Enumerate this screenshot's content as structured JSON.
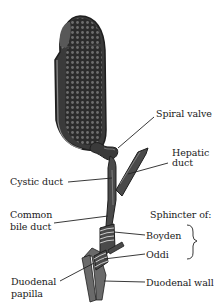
{
  "diagram": {
    "labels": {
      "spiral_valve": "Spiral valve",
      "hepatic_duct_line1": "Hepatic",
      "hepatic_duct_line2": "duct",
      "cystic_duct": "Cystic duct",
      "common_bile_duct_line1": "Common",
      "common_bile_duct_line2": "bile duct",
      "sphincter_of": "Sphincter of:",
      "boyden": "Boyden",
      "oddi": "Oddi",
      "duodenal_papilla_line1": "Duodenal",
      "duodenal_papilla_line2": "papilla",
      "duodenal_wall": "Duodenal wall"
    },
    "colors": {
      "organ_fill": "#3a3a3a",
      "organ_outline": "#1e1e1e",
      "duct_fill": "#555555",
      "duodenal_wall_fill": "#6a6a6a",
      "leader_line": "#222222",
      "text": "#1a1a1a"
    }
  }
}
